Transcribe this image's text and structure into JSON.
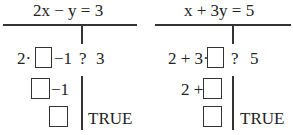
{
  "left": {
    "title": "2x − y = 3",
    "rows": [
      {
        "pre": "2·",
        "post": "−1",
        "q": "?",
        "rhs": "3"
      },
      {
        "pre": "",
        "post": "−1"
      },
      {
        "pre": "",
        "post": "",
        "result": "TRUE"
      }
    ]
  },
  "right": {
    "title": "x + 3y = 5",
    "rows": [
      {
        "pre": "2 + 3·",
        "post": "",
        "q": "?",
        "rhs": "5"
      },
      {
        "pre": "2 +",
        "post": ""
      },
      {
        "pre": "",
        "post": "",
        "result": "TRUE"
      }
    ]
  }
}
